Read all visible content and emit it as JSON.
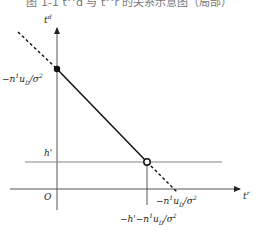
{
  "figure": {
    "title": "图 1-1  t^d 与 t^r 的关系示意图（局部）",
    "type": "diagram",
    "axes": {
      "vertical": {
        "label": "t",
        "superscript": "d"
      },
      "horizontal": {
        "label": "t",
        "superscript": "r"
      },
      "origin_label": "O"
    },
    "labels": {
      "y_intercept": "−n¹u_D/σ²",
      "y_intercept_parts": {
        "pre": "−n",
        "sup1": "1",
        "mid": "u",
        "sub": "D",
        "post": "/σ",
        "sup2": "2"
      },
      "h_prime": "h'",
      "x_intercept": "−n¹u_D/σ²",
      "x_intercept_parts": {
        "pre": "−n",
        "sup1": "1",
        "mid": "u",
        "sub": "D",
        "post": "/σ",
        "sup2": "2"
      },
      "kink_x": "−h'−n¹u_D/σ²",
      "kink_x_parts": {
        "pre": "−h'−n",
        "sup1": "1",
        "mid": "u",
        "sub": "D",
        "post": "/σ",
        "sup2": "2"
      }
    },
    "elements": {
      "solid_segment": "from filled point on t^d axis to open point on h' line",
      "dashed_extensions": [
        "upper-left beyond filled point",
        "lower-right from open point to t^r axis"
      ],
      "horizontal_reference_line": "t^d = h'",
      "vertical_drop_line": "from open point down below t^r axis",
      "filled_point": "intersection with t^d axis",
      "open_point": "intersection with h' line"
    },
    "colors": {
      "line": "#111111",
      "axis": "#555555",
      "reference": "#777777"
    }
  }
}
